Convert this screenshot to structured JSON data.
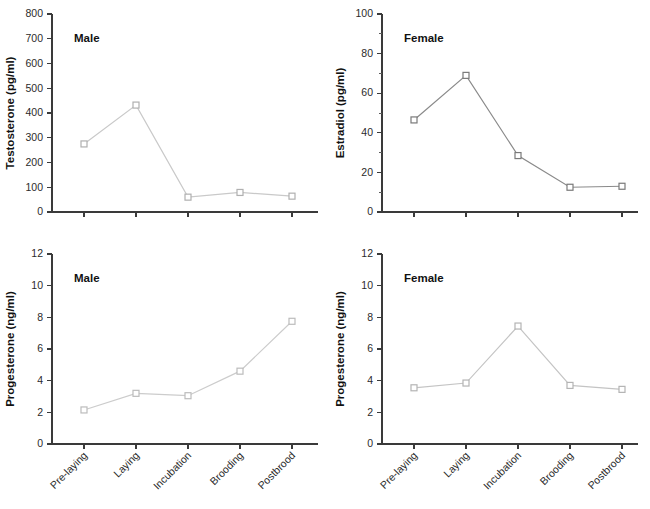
{
  "figure": {
    "categories": [
      "Pre-laying",
      "Laying",
      "Incubation",
      "Brooding",
      "Postbrood"
    ]
  },
  "chart_data": [
    {
      "id": "testosterone-male",
      "type": "line",
      "title": "",
      "annotation": "Male",
      "xlabel": "",
      "ylabel": "Testosterone (pg/ml)",
      "categories": [
        "Pre-laying",
        "Laying",
        "Incubation",
        "Brooding",
        "Postbrood"
      ],
      "values": [
        275,
        432,
        60,
        79,
        64
      ],
      "ylim": [
        0,
        800
      ],
      "ytick_step": 100,
      "yticks": [
        0,
        100,
        200,
        300,
        400,
        500,
        600,
        700,
        800
      ],
      "grid": false,
      "legend": "none",
      "line_color": "#c9c9c9",
      "marker_color": "#b0b0b0",
      "marker": "open-square"
    },
    {
      "id": "estradiol-female",
      "type": "line",
      "title": "",
      "annotation": "Female",
      "xlabel": "",
      "ylabel": "Estradiol (pg/ml)",
      "categories": [
        "Pre-laying",
        "Laying",
        "Incubation",
        "Brooding",
        "Postbrood"
      ],
      "values": [
        46.5,
        69,
        28.5,
        12.5,
        13
      ],
      "ylim": [
        0,
        100
      ],
      "ytick_step": 20,
      "yticks": [
        0,
        20,
        40,
        60,
        80,
        100
      ],
      "yticks_minor": [
        10,
        30,
        50,
        70,
        90
      ],
      "grid": false,
      "legend": "none",
      "line_color": "#8a8a8a",
      "marker_color": "#7a7a7a",
      "marker": "open-square"
    },
    {
      "id": "progesterone-male",
      "type": "line",
      "title": "",
      "annotation": "Male",
      "xlabel": "",
      "ylabel": "Progesterone (ng/ml)",
      "categories": [
        "Pre-laying",
        "Laying",
        "Incubation",
        "Brooding",
        "Postbrood"
      ],
      "values": [
        2.15,
        3.2,
        3.05,
        4.6,
        7.75
      ],
      "ylim": [
        0,
        12
      ],
      "ytick_step": 2,
      "yticks": [
        0,
        2,
        4,
        6,
        8,
        10,
        12
      ],
      "grid": false,
      "legend": "none",
      "line_color": "#cccccc",
      "marker_color": "#bcbcbc",
      "marker": "open-square"
    },
    {
      "id": "progesterone-female",
      "type": "line",
      "title": "",
      "annotation": "Female",
      "xlabel": "",
      "ylabel": "Progesterone (ng/ml)",
      "categories": [
        "Pre-laying",
        "Laying",
        "Incubation",
        "Brooding",
        "Postbrood"
      ],
      "values": [
        3.55,
        3.85,
        7.45,
        3.7,
        3.45
      ],
      "ylim": [
        0,
        12
      ],
      "ytick_step": 2,
      "yticks": [
        0,
        2,
        4,
        6,
        8,
        10,
        12
      ],
      "grid": false,
      "legend": "none",
      "line_color": "#c4c4c4",
      "marker_color": "#b4b4b4",
      "marker": "open-square"
    }
  ]
}
